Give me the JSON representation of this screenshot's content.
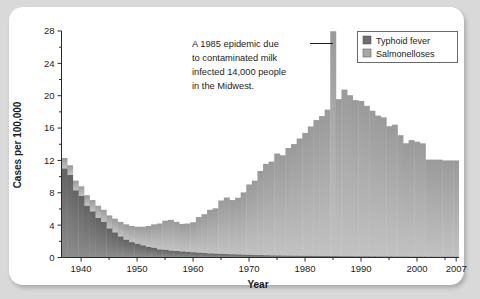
{
  "card": {
    "background": "#ffffff",
    "page_background": "#d9d9d9"
  },
  "chart_data": {
    "type": "bar",
    "stacked": true,
    "title": "",
    "xlabel": "Year",
    "ylabel": "Cases per 100,000",
    "xlim": [
      1937,
      2007
    ],
    "ylim": [
      0,
      28
    ],
    "yticks": [
      0,
      4,
      8,
      12,
      16,
      20,
      24,
      28
    ],
    "yticks_minor": [
      2,
      6,
      10,
      14,
      18,
      22,
      26
    ],
    "xticks": [
      1940,
      1950,
      1960,
      1970,
      1980,
      1990,
      2000,
      2007
    ],
    "xtick_labels": [
      "1940",
      "1950",
      "1960",
      "1970",
      "1980",
      "1990",
      "2000",
      "2007"
    ],
    "grid": false,
    "legend_position": "top-right",
    "colors": {
      "typhoid": "#6e6e6e",
      "salmonelloses": "#a8a8a8"
    },
    "x": [
      1937,
      1938,
      1939,
      1940,
      1941,
      1942,
      1943,
      1944,
      1945,
      1946,
      1947,
      1948,
      1949,
      1950,
      1951,
      1952,
      1953,
      1954,
      1955,
      1956,
      1957,
      1958,
      1959,
      1960,
      1961,
      1962,
      1963,
      1964,
      1965,
      1966,
      1967,
      1968,
      1969,
      1970,
      1971,
      1972,
      1973,
      1974,
      1975,
      1976,
      1977,
      1978,
      1979,
      1980,
      1981,
      1982,
      1983,
      1984,
      1985,
      1986,
      1987,
      1988,
      1989,
      1990,
      1991,
      1992,
      1993,
      1994,
      1995,
      1996,
      1997,
      1998,
      1999,
      2000,
      2001,
      2002,
      2003,
      2004,
      2005,
      2006,
      2007
    ],
    "series": [
      {
        "name": "Typhoid fever",
        "values": [
          11.0,
          10.2,
          8.3,
          7.6,
          6.4,
          5.7,
          4.9,
          4.4,
          3.6,
          3.1,
          2.6,
          2.2,
          1.9,
          1.7,
          1.5,
          1.3,
          1.2,
          1.0,
          0.95,
          0.85,
          0.8,
          0.75,
          0.7,
          0.65,
          0.6,
          0.55,
          0.5,
          0.48,
          0.45,
          0.42,
          0.4,
          0.38,
          0.35,
          0.33,
          0.3,
          0.3,
          0.28,
          0.26,
          0.25,
          0.24,
          0.23,
          0.22,
          0.21,
          0.2,
          0.2,
          0.19,
          0.18,
          0.18,
          0.17,
          0.17,
          0.16,
          0.16,
          0.15,
          0.15,
          0.15,
          0.14,
          0.14,
          0.13,
          0.13,
          0.12,
          0.12,
          0.12,
          0.11,
          0.11,
          0.11,
          0.1,
          0.1,
          0.1,
          0.1,
          0.1,
          0.1
        ]
      },
      {
        "name": "Salmonelloses",
        "values": [
          1.3,
          1.2,
          1.2,
          1.2,
          1.3,
          1.4,
          1.5,
          1.5,
          1.6,
          1.7,
          1.8,
          1.9,
          2.0,
          2.1,
          2.3,
          2.6,
          2.9,
          3.2,
          3.6,
          3.8,
          3.6,
          3.4,
          3.5,
          3.7,
          4.4,
          4.8,
          5.4,
          5.6,
          6.6,
          7.0,
          6.7,
          7.0,
          7.7,
          8.7,
          9.2,
          10.4,
          11.3,
          11.6,
          12.6,
          12.4,
          13.3,
          13.8,
          14.5,
          15.2,
          16.0,
          16.8,
          17.3,
          18.1,
          27.8,
          19.4,
          20.6,
          19.9,
          19.3,
          19.2,
          18.6,
          18.0,
          17.4,
          17.2,
          16.1,
          16.3,
          15.0,
          14.0,
          14.4,
          14.2,
          14.0,
          12.0,
          12.0,
          12.0,
          11.9,
          11.9,
          11.9
        ]
      }
    ],
    "annotation": {
      "lines": [
        "A 1985 epidemic due",
        "to contaminated milk",
        "infected 14,000 people",
        "in the Midwest."
      ],
      "points_to_year": 1985,
      "points_to_value": 28
    },
    "legend": [
      {
        "label": "Typhoid fever",
        "color": "#6e6e6e"
      },
      {
        "label": "Salmonelloses",
        "color": "#a8a8a8"
      }
    ]
  }
}
